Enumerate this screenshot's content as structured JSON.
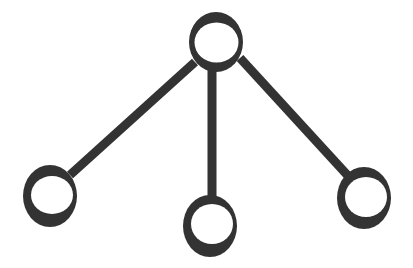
{
  "diagram": {
    "type": "tree",
    "width": 413,
    "height": 268,
    "colors": {
      "background": "#ffffff",
      "ink": "#333333"
    },
    "edge_width": 9,
    "nodes": [
      {
        "id": "root",
        "cx": 216,
        "cy": 42,
        "rx": 27,
        "ry": 30,
        "hole_cx": 216,
        "hole_cy": 42,
        "hole_rx": 22,
        "hole_ry": 20,
        "hole_dx": 0,
        "hole_dy": 0
      },
      {
        "id": "left",
        "cx": 50,
        "cy": 196,
        "rx": 27,
        "ry": 31,
        "hole_cx": 52,
        "hole_cy": 195,
        "hole_rx": 21,
        "hole_ry": 19
      },
      {
        "id": "middle",
        "cx": 210,
        "cy": 226,
        "rx": 27,
        "ry": 31,
        "hole_cx": 212,
        "hole_cy": 224,
        "hole_rx": 21,
        "hole_ry": 20
      },
      {
        "id": "right",
        "cx": 364,
        "cy": 198,
        "rx": 27,
        "ry": 31,
        "hole_cx": 366,
        "hole_cy": 197,
        "hole_rx": 21,
        "hole_ry": 20
      }
    ],
    "edges": [
      {
        "from": "root",
        "to": "left",
        "x1": 195,
        "y1": 62,
        "x2": 70,
        "y2": 175
      },
      {
        "from": "root",
        "to": "middle",
        "x1": 212,
        "y1": 70,
        "x2": 212,
        "y2": 197
      },
      {
        "from": "root",
        "to": "right",
        "x1": 240,
        "y1": 58,
        "x2": 350,
        "y2": 178
      }
    ]
  }
}
